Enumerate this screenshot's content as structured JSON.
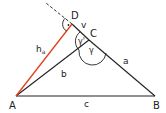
{
  "diagram": {
    "points": {
      "A": {
        "label": "A",
        "x": 16,
        "y": 96
      },
      "B": {
        "label": "B",
        "x": 155,
        "y": 96
      },
      "C": {
        "label": "C",
        "x": 89,
        "y": 40
      },
      "D": {
        "label": "D",
        "x": 72,
        "y": 24
      }
    },
    "sides": {
      "a": {
        "label": "a"
      },
      "b": {
        "label": "b"
      },
      "c": {
        "label": "c"
      },
      "v": {
        "label": "v"
      },
      "h_a": {
        "label": "h",
        "subscript": "a"
      }
    },
    "angles": {
      "gamma": "γ",
      "gamma_prime": "γ'",
      "right_angle_marker": "·"
    },
    "colors": {
      "line": "#222222",
      "altitude": "#e0401a",
      "background": "#ffffff"
    }
  }
}
